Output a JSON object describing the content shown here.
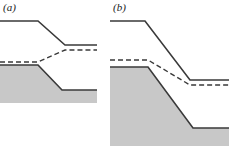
{
  "figure": {
    "width": 229,
    "height": 146,
    "background_color": "#ffffff",
    "type": "two-panel schematic cross-section diagram"
  },
  "style": {
    "fill_gray": "#c8c8c8",
    "line_color": "#3a3a3a",
    "solid_line_width": 1.6,
    "dashed_line_width": 1.4,
    "dash_pattern": "5,3",
    "label_color": "#1a1a1a"
  },
  "panels": [
    {
      "id": "a",
      "label": "(a)",
      "origin_x": 0,
      "width": 100,
      "height": 146,
      "curves": {
        "solid_surface": {
          "name": "solid-surface-line",
          "style": "solid",
          "points": [
            [
              0,
              21
            ],
            [
              38,
              21
            ],
            [
              65,
              45
            ],
            [
              97,
              45
            ]
          ]
        },
        "dashed_level": {
          "name": "dashed-level-line",
          "style": "dashed",
          "points": [
            [
              0,
              62
            ],
            [
              38,
              62
            ],
            [
              65,
              50
            ],
            [
              97,
              50
            ]
          ]
        },
        "gray_top": {
          "name": "gray-region-top-boundary",
          "style": "solid",
          "points": [
            [
              0,
              65
            ],
            [
              38,
              65
            ],
            [
              62,
              90
            ],
            [
              97,
              90
            ]
          ]
        }
      },
      "gray_region": {
        "name": "gray-filled-region",
        "polygon": [
          [
            0,
            65
          ],
          [
            38,
            65
          ],
          [
            62,
            90
          ],
          [
            97,
            90
          ],
          [
            97,
            103
          ],
          [
            0,
            103
          ]
        ]
      }
    },
    {
      "id": "b",
      "label": "(b)",
      "origin_x": 110,
      "width": 119,
      "height": 146,
      "curves": {
        "solid_surface": {
          "name": "solid-surface-line",
          "style": "solid",
          "points": [
            [
              0,
              21
            ],
            [
              35,
              21
            ],
            [
              80,
              80
            ],
            [
              119,
              80
            ]
          ]
        },
        "dashed_level": {
          "name": "dashed-level-line",
          "style": "dashed",
          "points": [
            [
              0,
              60
            ],
            [
              38,
              60
            ],
            [
              80,
              85
            ],
            [
              119,
              85
            ]
          ]
        },
        "gray_top": {
          "name": "gray-region-top-boundary",
          "style": "solid",
          "points": [
            [
              0,
              67
            ],
            [
              38,
              67
            ],
            [
              83,
              128
            ],
            [
              119,
              128
            ]
          ]
        }
      },
      "gray_region": {
        "name": "gray-filled-region",
        "polygon": [
          [
            0,
            67
          ],
          [
            38,
            67
          ],
          [
            83,
            128
          ],
          [
            119,
            128
          ],
          [
            119,
            146
          ],
          [
            0,
            146
          ]
        ]
      }
    }
  ],
  "chart_data": {
    "type": "line",
    "title": "",
    "xlabel": "",
    "ylabel": "",
    "panels": [
      "(a)",
      "(b)"
    ],
    "series": [
      {
        "panel": "(a)",
        "name": "solid surface",
        "style": "solid",
        "x": [
          0,
          38,
          65,
          97
        ],
        "y": [
          21,
          21,
          45,
          45
        ]
      },
      {
        "panel": "(a)",
        "name": "dashed level",
        "style": "dashed",
        "x": [
          0,
          38,
          65,
          97
        ],
        "y": [
          62,
          62,
          50,
          50
        ]
      },
      {
        "panel": "(a)",
        "name": "gray body top",
        "style": "solid-filled",
        "x": [
          0,
          38,
          62,
          97
        ],
        "y": [
          65,
          65,
          90,
          90
        ]
      },
      {
        "panel": "(b)",
        "name": "solid surface",
        "style": "solid",
        "x": [
          0,
          35,
          80,
          119
        ],
        "y": [
          21,
          21,
          80,
          80
        ]
      },
      {
        "panel": "(b)",
        "name": "dashed level",
        "style": "dashed",
        "x": [
          0,
          38,
          80,
          119
        ],
        "y": [
          60,
          60,
          85,
          85
        ]
      },
      {
        "panel": "(b)",
        "name": "gray body top",
        "style": "solid-filled",
        "x": [
          0,
          38,
          83,
          119
        ],
        "y": [
          67,
          67,
          128,
          128
        ]
      }
    ],
    "grid": false,
    "legend": "none"
  }
}
